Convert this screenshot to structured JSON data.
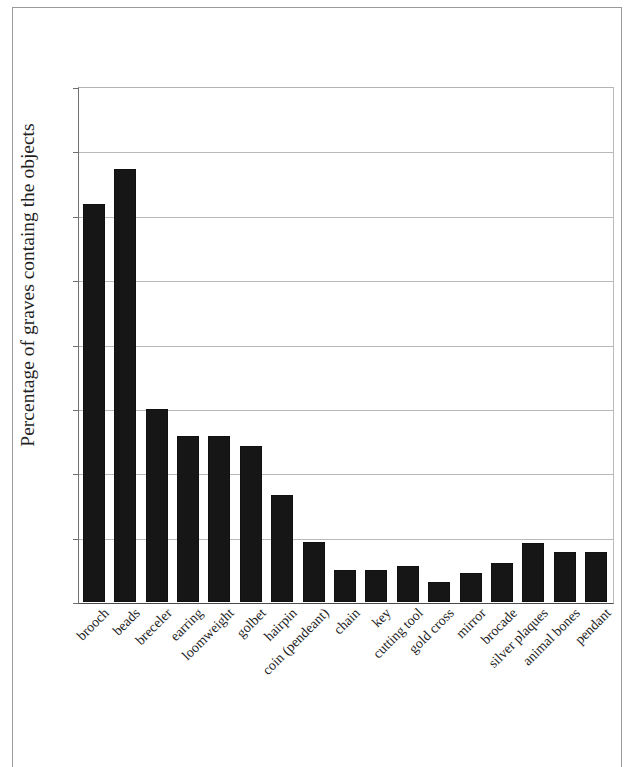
{
  "chart_data": {
    "type": "bar",
    "title": "",
    "subtitle": "",
    "xlabel": "",
    "ylabel": "Percentage of graves containg the objects",
    "ylim": [
      0,
      8
    ],
    "ytick_labels": [
      "0%",
      "1%",
      "2%",
      "3%",
      "4%",
      "5%",
      "6%",
      "7%",
      "8%"
    ],
    "ytick_values": [
      0,
      1,
      2,
      3,
      4,
      5,
      6,
      7,
      8
    ],
    "yunit": "%",
    "grid": true,
    "legend": "none",
    "bar_color": "#161616",
    "categories": [
      "brooch",
      "beads",
      "breceler",
      "earring",
      "loomweight",
      "golbet",
      "hairpin",
      "coin (pendeant)",
      "chain",
      "key",
      "cutting tool",
      "gold cross",
      "mirror",
      "brocade",
      "silver plaques",
      "animal bones",
      "pendant"
    ],
    "values": [
      6.19,
      6.72,
      3.0,
      2.58,
      2.58,
      2.42,
      1.66,
      0.93,
      0.5,
      0.5,
      0.56,
      0.31,
      0.45,
      0.61,
      0.92,
      0.77,
      0.77
    ]
  }
}
